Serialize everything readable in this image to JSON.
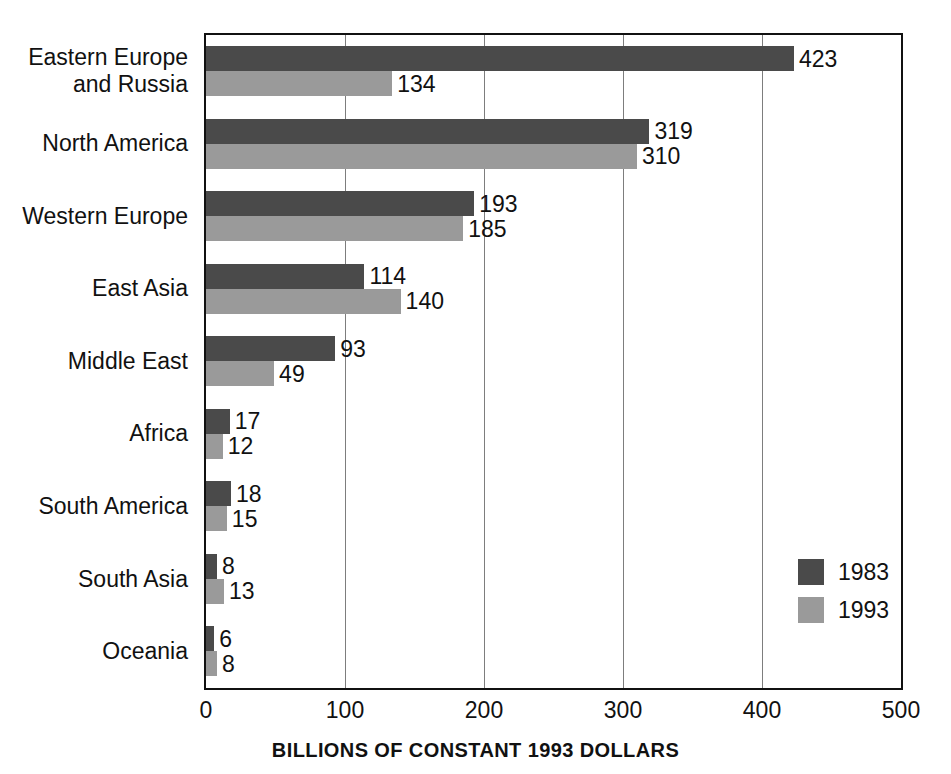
{
  "chart_data": {
    "type": "bar",
    "orientation": "horizontal",
    "title": "",
    "xlabel": "BILLIONS OF CONSTANT 1993 DOLLARS",
    "ylabel": "",
    "xlim": [
      0,
      500
    ],
    "xticks": [
      0,
      100,
      200,
      300,
      400,
      500
    ],
    "xtick_labels": [
      "0",
      "100",
      "200",
      "300",
      "400",
      "500"
    ],
    "grid": true,
    "grid_axis": "x",
    "legend_position": "inside-right",
    "categories": [
      "Eastern Europe\nand Russia",
      "North America",
      "Western Europe",
      "East Asia",
      "Middle East",
      "Africa",
      "South America",
      "South Asia",
      "Oceania"
    ],
    "series": [
      {
        "name": "1983",
        "color": "#4a4a4a",
        "values": [
          423,
          319,
          193,
          114,
          93,
          17,
          18,
          8,
          6
        ]
      },
      {
        "name": "1993",
        "color": "#9a9a9a",
        "values": [
          134,
          310,
          185,
          140,
          49,
          12,
          15,
          13,
          8
        ]
      }
    ]
  },
  "legend": {
    "items": [
      {
        "label": "1983",
        "color": "#4a4a4a"
      },
      {
        "label": "1993",
        "color": "#9a9a9a"
      }
    ]
  }
}
